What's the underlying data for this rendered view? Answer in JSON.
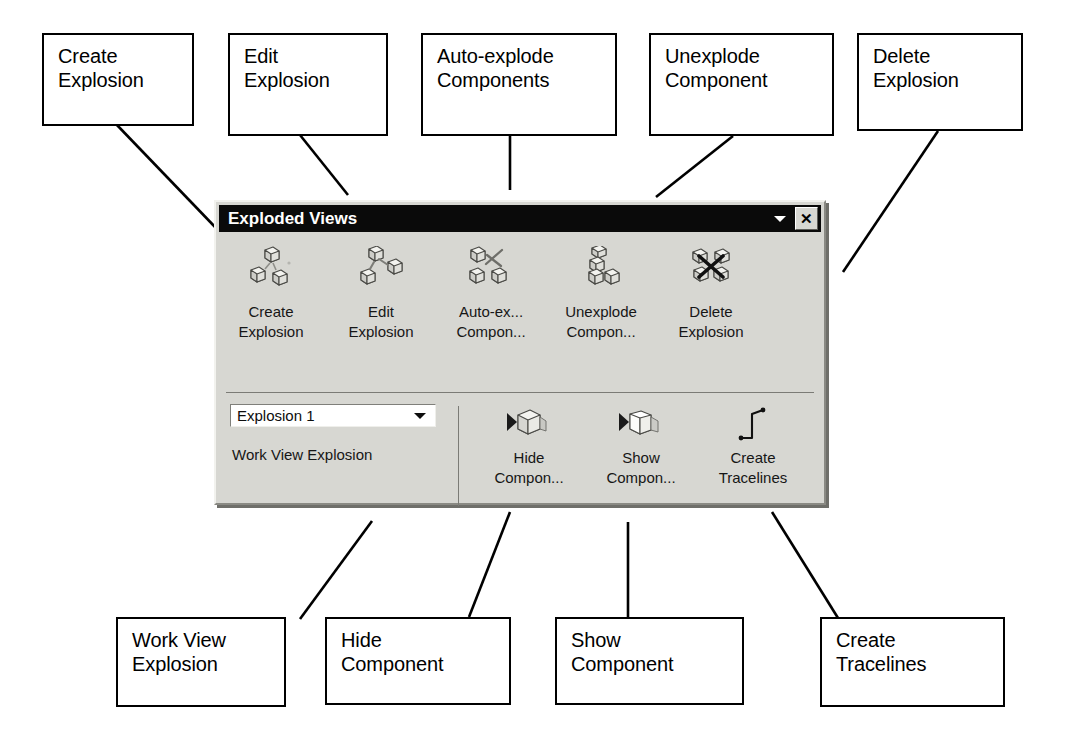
{
  "diagram": {
    "callouts": [
      {
        "id": "create-explosion",
        "text": "Create\nExplosion"
      },
      {
        "id": "edit-explosion",
        "text": "Edit\nExplosion"
      },
      {
        "id": "auto-explode",
        "text": "Auto-explode\nComponents"
      },
      {
        "id": "unexplode-component",
        "text": "Unexplode\nComponent"
      },
      {
        "id": "delete-explosion",
        "text": "Delete\nExplosion"
      },
      {
        "id": "work-view-explosion",
        "text": "Work  View\nExplosion"
      },
      {
        "id": "hide-component",
        "text": "Hide\nComponent"
      },
      {
        "id": "show-component",
        "text": "Show\nComponent"
      },
      {
        "id": "create-tracelines",
        "text": "Create\nTracelines"
      }
    ]
  },
  "toolbar": {
    "title": "Exploded Views",
    "close_label": "✕",
    "top_buttons": [
      {
        "icon": "create-explosion-icon",
        "caption": "Create\nExplosion"
      },
      {
        "icon": "edit-explosion-icon",
        "caption": "Edit\nExplosion"
      },
      {
        "icon": "auto-explode-icon",
        "caption": "Auto-ex...\nCompon..."
      },
      {
        "icon": "unexplode-component-icon",
        "caption": "Unexplode\nCompon..."
      },
      {
        "icon": "delete-explosion-icon",
        "caption": "Delete\nExplosion"
      }
    ],
    "explosion_select": {
      "value": "Explosion 1",
      "options": [
        "Explosion 1"
      ]
    },
    "work_view_label": "Work View Explosion",
    "bottom_buttons": [
      {
        "icon": "hide-component-icon",
        "caption": "Hide\nCompon..."
      },
      {
        "icon": "show-component-icon",
        "caption": "Show\nCompon..."
      },
      {
        "icon": "create-tracelines-icon",
        "caption": "Create\nTracelines"
      }
    ]
  },
  "colors": {
    "panel_face": "#d7d7d2",
    "titlebar": "#0a0a0a",
    "titlebar_text": "#ffffff",
    "callout_border": "#000000",
    "leader_line": "#000000",
    "combo_field": "#ffffff"
  }
}
